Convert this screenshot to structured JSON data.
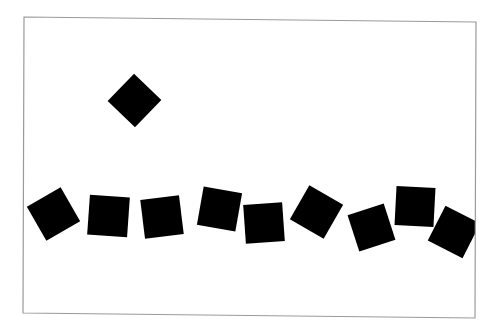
{
  "canvas": {
    "width": 499,
    "height": 325,
    "background": "#ffffff"
  },
  "frame": {
    "stroke": "#9a9a9a",
    "stroke_width": 1.2,
    "points": [
      [
        24,
        17
      ],
      [
        476,
        22
      ],
      [
        475,
        318
      ],
      [
        23,
        313
      ]
    ]
  },
  "shapes": {
    "fill": "#000000",
    "diamond": {
      "cx": 134.5,
      "cy": 100.5,
      "side": 38,
      "rotation": 44
    },
    "row": [
      {
        "cx": 53.5,
        "cy": 214,
        "side": 39,
        "rotation": -30
      },
      {
        "cx": 108.5,
        "cy": 216,
        "side": 40,
        "rotation": 4
      },
      {
        "cx": 162,
        "cy": 217,
        "side": 39,
        "rotation": -7
      },
      {
        "cx": 219.5,
        "cy": 209,
        "side": 39,
        "rotation": 10
      },
      {
        "cx": 264,
        "cy": 223,
        "side": 39,
        "rotation": -4
      },
      {
        "cx": 316.5,
        "cy": 212,
        "side": 39,
        "rotation": 30
      },
      {
        "cx": 371.5,
        "cy": 227.5,
        "side": 38,
        "rotation": -18
      },
      {
        "cx": 415,
        "cy": 206.5,
        "side": 39,
        "rotation": 3
      },
      {
        "cx": 454,
        "cy": 232,
        "side": 39,
        "rotation": 27
      }
    ]
  }
}
